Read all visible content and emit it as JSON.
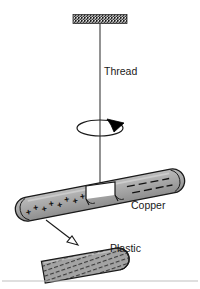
{
  "figure": {
    "background_color": "#ffffff",
    "width": 200,
    "height": 289
  },
  "labels": {
    "thread": "Thread",
    "copper": "Copper",
    "plastic": "Plastic"
  },
  "parts": {
    "ceiling_support": {
      "name": "hatched ceiling support bar",
      "fill": "#8a8a8a",
      "stroke": "#2b2b2b"
    },
    "thread": {
      "name": "vertical thread line",
      "stroke": "#333333"
    },
    "rotation_indicator": {
      "name": "spin ellipse with arrowhead",
      "stroke": "#1a1a1a",
      "arrow_fill": "#000000"
    },
    "clamp": {
      "name": "thread clamp bracket on copper rod",
      "fill": "#ffffff",
      "stroke": "#1a1a1a"
    },
    "copper_rod": {
      "name": "copper rod",
      "fill": "#a6a6a6",
      "stroke": "#1a1a1a",
      "positive_end": "left",
      "negative_end": "right"
    },
    "plastic_rod": {
      "name": "plastic rod",
      "fill": "#a0a0a0",
      "stroke": "#1a1a1a",
      "hatched": "true"
    },
    "pointer_arrow": {
      "name": "hollow arrow from copper to plastic",
      "stroke": "#1a1a1a",
      "fill": "#ffffff"
    },
    "baseline": {
      "name": "faint horizontal rule near bottom",
      "stroke": "#b5b5b5"
    }
  },
  "charges": {
    "positive_symbol": "+",
    "negative_symbol": "−",
    "positive_marks": [
      {
        "x": 21,
        "y": 214
      },
      {
        "x": 27,
        "y": 212
      },
      {
        "x": 33,
        "y": 211
      },
      {
        "x": 39,
        "y": 209
      },
      {
        "x": 45,
        "y": 208
      },
      {
        "x": 51,
        "y": 206
      },
      {
        "x": 57,
        "y": 205
      },
      {
        "x": 62,
        "y": 203
      }
    ],
    "negative_marks": [
      {
        "x": 148,
        "y": 186
      },
      {
        "x": 158,
        "y": 184
      },
      {
        "x": 168,
        "y": 182
      },
      {
        "x": 150,
        "y": 178
      },
      {
        "x": 160,
        "y": 176
      },
      {
        "x": 170,
        "y": 174
      },
      {
        "x": 178,
        "y": 180
      },
      {
        "x": 180,
        "y": 172
      }
    ],
    "plastic_marks": [
      {
        "x": 58,
        "y": 268
      },
      {
        "x": 70,
        "y": 266
      },
      {
        "x": 82,
        "y": 264
      },
      {
        "x": 94,
        "y": 262
      },
      {
        "x": 106,
        "y": 260
      },
      {
        "x": 64,
        "y": 261
      },
      {
        "x": 76,
        "y": 259
      },
      {
        "x": 88,
        "y": 257
      },
      {
        "x": 100,
        "y": 255
      },
      {
        "x": 112,
        "y": 253
      },
      {
        "x": 70,
        "y": 254
      },
      {
        "x": 82,
        "y": 252
      },
      {
        "x": 94,
        "y": 250
      },
      {
        "x": 106,
        "y": 248
      }
    ]
  }
}
